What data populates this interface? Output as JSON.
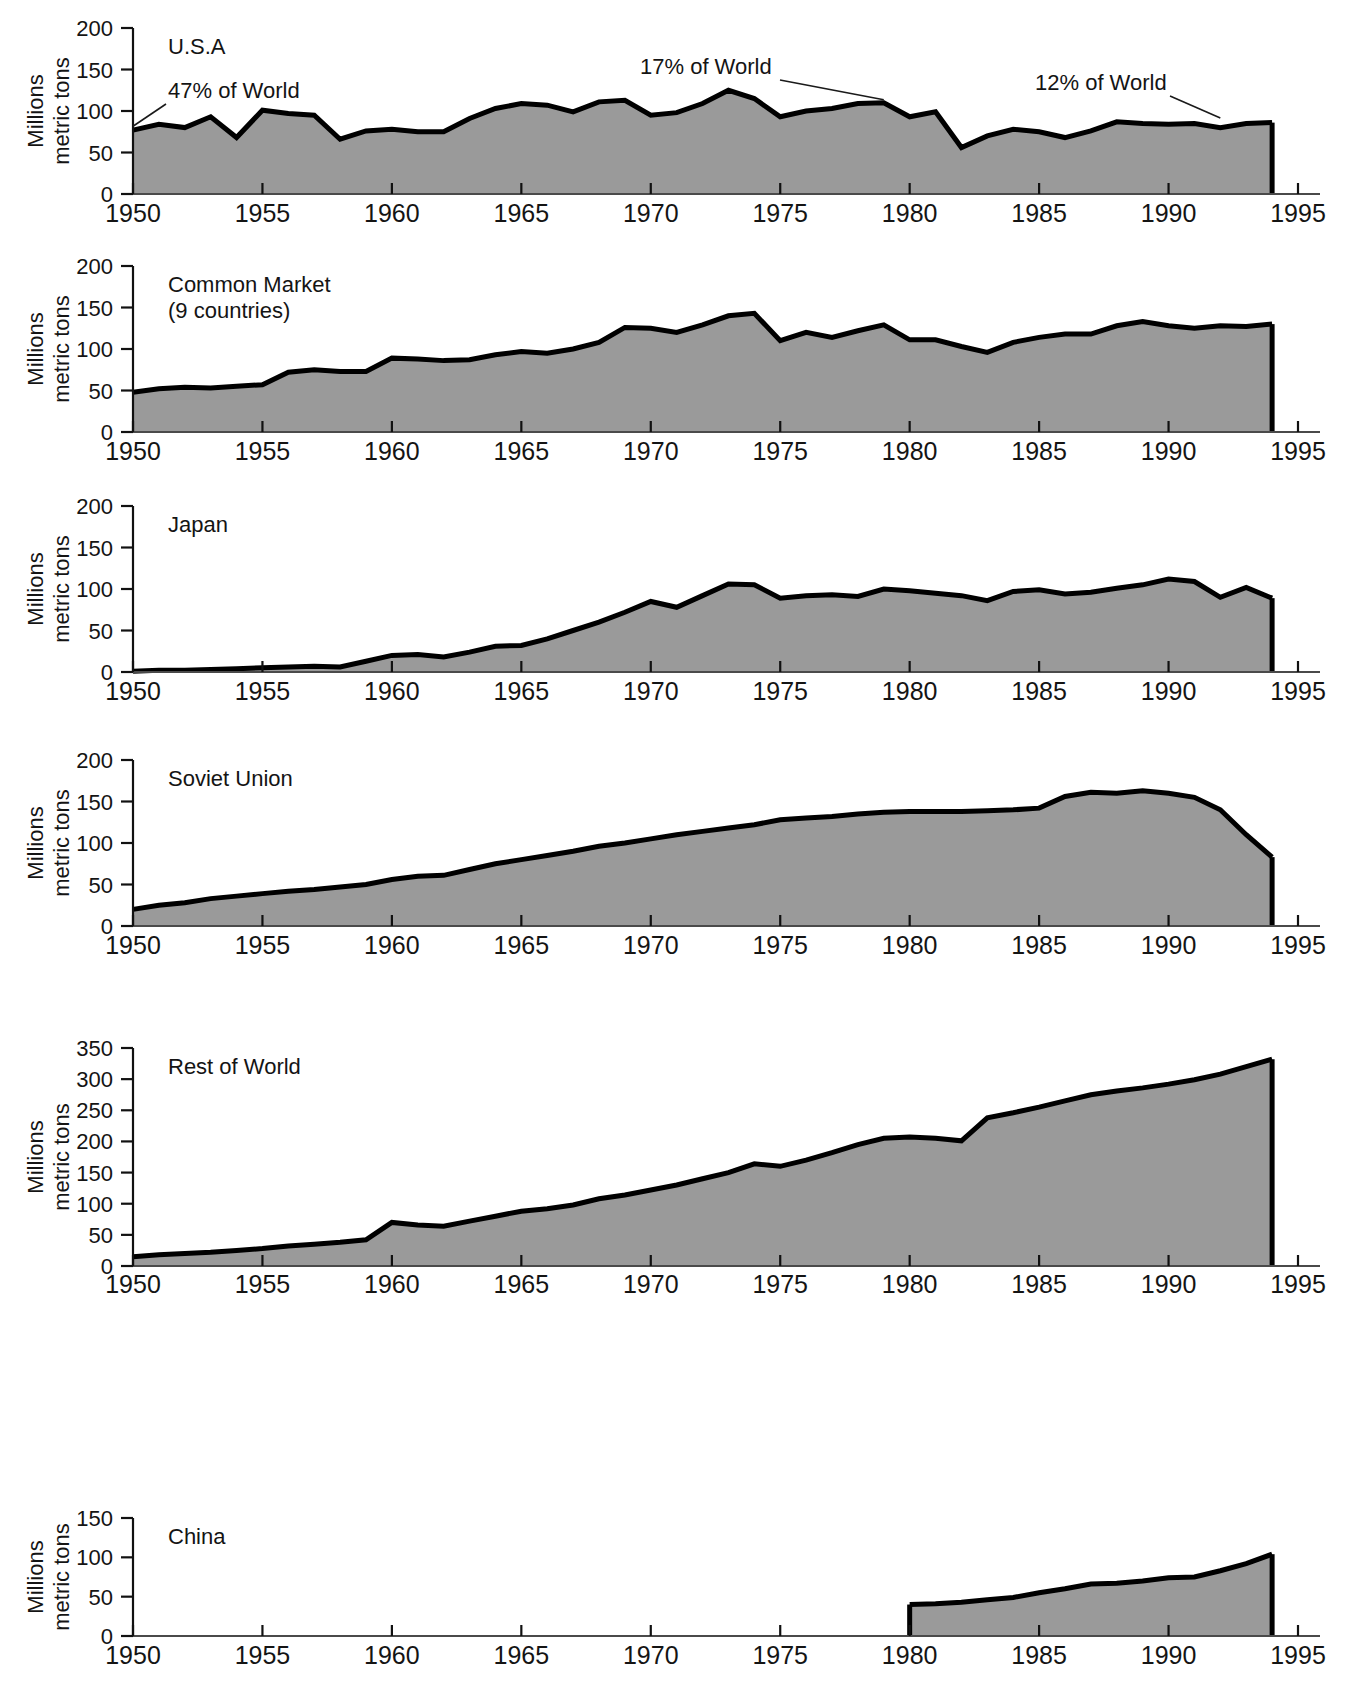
{
  "figure": {
    "background_color": "#ffffff",
    "area_fill_color": "#9a9a9a",
    "line_color": "#000000",
    "axis_color": "#111111"
  },
  "axis": {
    "y_title_line1": "Millions",
    "y_title_line2": "metric tons",
    "x_ticks": [
      "1950",
      "1955",
      "1960",
      "1965",
      "1970",
      "1975",
      "1980",
      "1985",
      "1990",
      "1995"
    ],
    "x_tick_values": [
      1950,
      1955,
      1960,
      1965,
      1970,
      1975,
      1980,
      1985,
      1990,
      1995
    ],
    "x_range": [
      1950,
      1995
    ]
  },
  "panels": [
    {
      "id": "usa",
      "title": "U.S.A",
      "y_ticks": [
        "0",
        "50",
        "100",
        "150",
        "200"
      ],
      "y_tick_values": [
        0,
        50,
        100,
        150,
        200
      ],
      "ylim": [
        0,
        200
      ],
      "annotations": [
        {
          "text": "47% of World",
          "year": 1950,
          "value": 78
        },
        {
          "text": "17% of World",
          "year": 1979,
          "value": 110
        },
        {
          "text": "12% of World",
          "year": 1992,
          "value": 88
        }
      ]
    },
    {
      "id": "common-market",
      "title": "Common Market",
      "subtitle": "(9 countries)",
      "y_ticks": [
        "0",
        "50",
        "100",
        "150",
        "200"
      ],
      "y_tick_values": [
        0,
        50,
        100,
        150,
        200
      ],
      "ylim": [
        0,
        200
      ],
      "annotations": []
    },
    {
      "id": "japan",
      "title": "Japan",
      "y_ticks": [
        "0",
        "50",
        "100",
        "150",
        "200"
      ],
      "y_tick_values": [
        0,
        50,
        100,
        150,
        200
      ],
      "ylim": [
        0,
        200
      ],
      "annotations": []
    },
    {
      "id": "soviet-union",
      "title": "Soviet Union",
      "y_ticks": [
        "0",
        "50",
        "100",
        "150",
        "200"
      ],
      "y_tick_values": [
        0,
        50,
        100,
        150,
        200
      ],
      "ylim": [
        0,
        200
      ],
      "annotations": []
    },
    {
      "id": "rest-of-world",
      "title": "Rest of World",
      "y_ticks": [
        "0",
        "50",
        "100",
        "150",
        "200",
        "250",
        "300",
        "350"
      ],
      "y_tick_values": [
        0,
        50,
        100,
        150,
        200,
        250,
        300,
        350
      ],
      "ylim": [
        0,
        350
      ],
      "annotations": []
    },
    {
      "id": "china",
      "title": "China",
      "y_ticks": [
        "0",
        "50",
        "100",
        "150"
      ],
      "y_tick_values": [
        0,
        50,
        100,
        150
      ],
      "ylim": [
        0,
        150
      ],
      "annotations": []
    }
  ],
  "chart_data": {
    "type": "area",
    "xlabel": "",
    "ylabel": "Millions metric tons",
    "xlim": [
      1950,
      1995
    ],
    "grid": false,
    "legend": "none",
    "x": [
      1950,
      1951,
      1952,
      1953,
      1954,
      1955,
      1956,
      1957,
      1958,
      1959,
      1960,
      1961,
      1962,
      1963,
      1964,
      1965,
      1966,
      1967,
      1968,
      1969,
      1970,
      1971,
      1972,
      1973,
      1974,
      1975,
      1976,
      1977,
      1978,
      1979,
      1980,
      1981,
      1982,
      1983,
      1984,
      1985,
      1986,
      1987,
      1988,
      1989,
      1990,
      1991,
      1992,
      1993,
      1994
    ],
    "series": [
      {
        "name": "U.S.A",
        "ylim": [
          0,
          200
        ],
        "values": [
          77,
          84,
          80,
          93,
          68,
          101,
          97,
          95,
          66,
          76,
          78,
          75,
          75,
          91,
          103,
          109,
          107,
          99,
          111,
          113,
          95,
          98,
          109,
          125,
          115,
          93,
          100,
          103,
          109,
          110,
          93,
          99,
          56,
          70,
          78,
          75,
          68,
          76,
          87,
          85,
          84,
          85,
          80,
          85,
          86
        ],
        "annotations": [
          {
            "text": "47% of World",
            "year": 1950,
            "value": 77
          },
          {
            "text": "17% of World",
            "year": 1979,
            "value": 110
          },
          {
            "text": "12% of World",
            "year": 1992,
            "value": 80
          }
        ]
      },
      {
        "name": "Common Market (9 countries)",
        "ylim": [
          0,
          200
        ],
        "values": [
          48,
          52,
          54,
          53,
          55,
          57,
          72,
          75,
          73,
          73,
          89,
          88,
          86,
          87,
          93,
          97,
          95,
          100,
          108,
          126,
          125,
          120,
          129,
          140,
          143,
          110,
          120,
          114,
          122,
          129,
          111,
          111,
          103,
          96,
          108,
          114,
          118,
          118,
          128,
          133,
          128,
          125,
          128,
          127,
          130
        ]
      },
      {
        "name": "Japan",
        "ylim": [
          0,
          200
        ],
        "values": [
          1,
          2,
          2,
          3,
          4,
          5,
          6,
          7,
          6,
          13,
          20,
          21,
          18,
          24,
          31,
          32,
          40,
          50,
          60,
          72,
          85,
          78,
          92,
          106,
          105,
          89,
          92,
          93,
          91,
          100,
          98,
          95,
          92,
          86,
          97,
          99,
          94,
          96,
          101,
          105,
          112,
          109,
          90,
          102,
          89
        ]
      },
      {
        "name": "Soviet Union",
        "ylim": [
          0,
          200
        ],
        "values": [
          20,
          25,
          28,
          33,
          36,
          39,
          42,
          44,
          47,
          50,
          56,
          60,
          61,
          68,
          75,
          80,
          85,
          90,
          96,
          100,
          105,
          110,
          114,
          118,
          122,
          128,
          130,
          132,
          135,
          137,
          138,
          138,
          138,
          139,
          140,
          142,
          156,
          161,
          160,
          163,
          160,
          155,
          140,
          110,
          83
        ]
      },
      {
        "name": "Rest of World",
        "ylim": [
          0,
          350
        ],
        "values": [
          15,
          18,
          20,
          22,
          25,
          28,
          32,
          35,
          38,
          42,
          70,
          66,
          64,
          72,
          80,
          88,
          92,
          98,
          108,
          114,
          122,
          130,
          140,
          150,
          164,
          160,
          170,
          182,
          195,
          205,
          207,
          205,
          201,
          238,
          246,
          255,
          265,
          275,
          281,
          286,
          292,
          299,
          308,
          320,
          332
        ]
      },
      {
        "name": "China",
        "ylim": [
          0,
          150
        ],
        "start_year": 1980,
        "values": [
          null,
          null,
          null,
          null,
          null,
          null,
          null,
          null,
          null,
          null,
          null,
          null,
          null,
          null,
          null,
          null,
          null,
          null,
          null,
          null,
          null,
          null,
          null,
          null,
          null,
          null,
          null,
          null,
          null,
          null,
          40,
          41,
          43,
          46,
          49,
          55,
          60,
          66,
          67,
          70,
          74,
          75,
          83,
          92,
          104
        ]
      }
    ]
  }
}
